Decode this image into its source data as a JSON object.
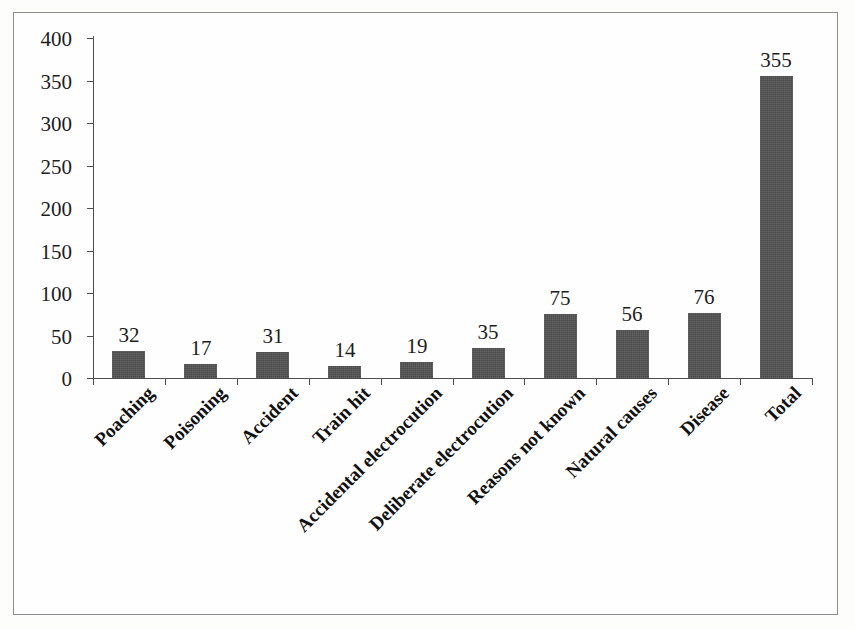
{
  "chart_data": {
    "type": "bar",
    "title": "",
    "subtitle": "",
    "xlabel": "",
    "ylabel": "",
    "ylim": [
      0,
      400
    ],
    "ytick_step": 50,
    "yticks": [
      0,
      50,
      100,
      150,
      200,
      250,
      300,
      350,
      400
    ],
    "ytick_labels": [
      "0",
      "50",
      "100",
      "150",
      "200",
      "250",
      "300",
      "350",
      "400"
    ],
    "grid": false,
    "legend": false,
    "legend_position": "none",
    "bar_color": "#4a4a4a",
    "data_labels_shown": true,
    "xtick_label_rotation": 45,
    "categories": [
      "Poaching",
      "Poisoning",
      "Accident",
      "Train hit",
      "Accidental electrocution",
      "Deliberate electrocution",
      "Reasons not known",
      "Natural causes",
      "Disease",
      "Total"
    ],
    "values": [
      32,
      17,
      31,
      14,
      19,
      35,
      75,
      56,
      76,
      355
    ],
    "value_labels": [
      "32",
      "17",
      "31",
      "14",
      "19",
      "35",
      "75",
      "56",
      "76",
      "355"
    ]
  },
  "figure": {
    "background_color": "#fefefe",
    "frame_color": "#8d8d8d",
    "axis_color": "#4d4d4d",
    "text_color": "#1d1d1d"
  }
}
